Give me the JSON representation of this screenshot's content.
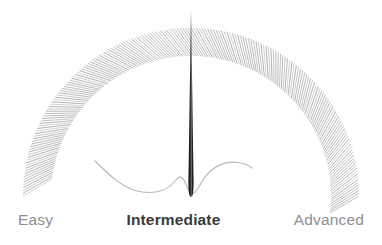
{
  "widget": {
    "name": "difficulty-gauge",
    "background_color": "#ffffff"
  },
  "gauge": {
    "center_x": 191,
    "center_y": 196,
    "outer_radius": 168,
    "inner_radius": 140,
    "start_angle_deg": 180,
    "end_angle_deg": 360,
    "tick_count": 190,
    "tick_color": "#b4b4b4",
    "tick_slant_deg": 7,
    "tick_width": 1
  },
  "needle": {
    "name": "gauge-needle",
    "value_percent": 50,
    "angle_deg": 270,
    "tip_y": 8,
    "base_y": 197,
    "base_half_width": 2.6,
    "color": "#1f1f1f",
    "highlight_color": "#6f6f6f"
  },
  "trace": {
    "name": "signal-trace",
    "color": "#b9b9b9",
    "width": 1.2,
    "path": "M 95 161 C 108 174, 124 190, 142 192 C 158 194, 168 190, 176 180 C 182 172, 185 182, 189 191 C 193 198, 197 190, 203 180 C 212 166, 226 160, 240 163 C 246 164, 250 166, 252 168"
  },
  "labels": {
    "easy": "Easy",
    "intermediate": "Intermediate",
    "advanced": "Advanced",
    "selected": "Intermediate",
    "muted_color": "#8e8e8e",
    "active_color": "#3a3a3a"
  }
}
